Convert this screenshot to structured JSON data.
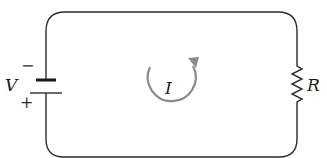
{
  "diagram": {
    "type": "circuit",
    "battery": {
      "label": "V",
      "minus_sign": "−",
      "plus_sign": "+"
    },
    "resistor": {
      "label": "R"
    },
    "current": {
      "label": "I",
      "direction": "counterclockwise",
      "color": "#8c8c8c"
    },
    "colors": {
      "wire": "#2b2b2b",
      "background": "#ffffff"
    }
  }
}
